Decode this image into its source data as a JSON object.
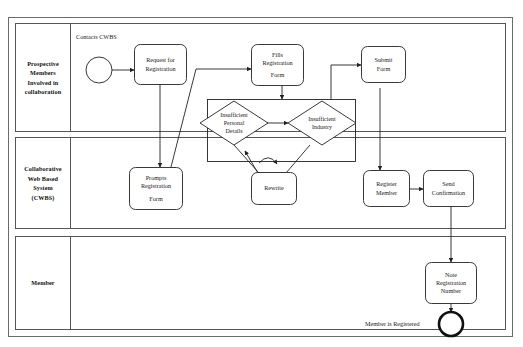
{
  "diagram": {
    "type": "bpmn-swimlane-process",
    "lanes": [
      {
        "id": "lane-prospective-members",
        "label": "Prospective Members Involved in collaboration",
        "label_lines": [
          "Prospective",
          "Members",
          "Involved in",
          "collaboration"
        ]
      },
      {
        "id": "lane-cwbs",
        "label": "Collaborative Web Based System (CWBS)",
        "label_lines": [
          "Collaborative",
          "Web Based",
          "System",
          "(CWBS)"
        ]
      },
      {
        "id": "lane-member",
        "label": "Member",
        "label_lines": [
          "Member"
        ]
      }
    ],
    "events": [
      {
        "id": "start-event",
        "kind": "start",
        "label": "Contacts CWBS",
        "lane": "lane-prospective-members"
      },
      {
        "id": "end-event",
        "kind": "end",
        "label": "Member is Registered",
        "lane": "lane-member"
      }
    ],
    "tasks": [
      {
        "id": "task-request-registration",
        "label": "Request for Registration",
        "label_lines": [
          "Request for",
          "Registration"
        ],
        "lane": "lane-prospective-members"
      },
      {
        "id": "task-fills-registration-form",
        "label": "Fills Registration Form",
        "label_lines": [
          "Fills",
          "Registration",
          "Form"
        ],
        "lane": "lane-prospective-members"
      },
      {
        "id": "task-submit-form",
        "label": "Submit Form",
        "label_lines": [
          "Submit",
          "Form"
        ],
        "lane": "lane-prospective-members"
      },
      {
        "id": "task-prompts-registration-form",
        "label": "Prompts Registration Form",
        "label_lines": [
          "Prompts",
          "Registration",
          "Form"
        ],
        "lane": "lane-cwbs"
      },
      {
        "id": "task-rewrite",
        "label": "Rewrite",
        "label_lines": [
          "Rewrite"
        ],
        "lane": "lane-cwbs"
      },
      {
        "id": "task-register-member",
        "label": "Register Member",
        "label_lines": [
          "Register",
          "Member"
        ],
        "lane": "lane-cwbs"
      },
      {
        "id": "task-send-confirmation",
        "label": "Send Confirmation",
        "label_lines": [
          "Send",
          "Confirmation"
        ],
        "lane": "lane-cwbs"
      },
      {
        "id": "task-note-registration-number",
        "label": "Note Registration Number",
        "label_lines": [
          "Note",
          "Registration",
          "Number"
        ],
        "lane": "lane-member"
      }
    ],
    "gateways": [
      {
        "id": "gateway-insufficient-personal-details",
        "label": "Insufficient Personal Details",
        "label_lines": [
          "Insufficient",
          "Personal",
          "Details"
        ],
        "lane": "lane-cwbs"
      },
      {
        "id": "gateway-insufficient-industry",
        "label": "Insufficient Industry",
        "label_lines": [
          "Insufficient",
          "Industry"
        ],
        "lane": "lane-cwbs"
      }
    ],
    "subprocess": {
      "id": "subprocess-validation",
      "label": "",
      "contains": [
        "gateway-insufficient-personal-details",
        "gateway-insufficient-industry"
      ]
    },
    "colors": {
      "stroke": "#222222",
      "lane_stroke": "#555555",
      "fill": "#ffffff",
      "text": "#1a1a1a"
    }
  }
}
